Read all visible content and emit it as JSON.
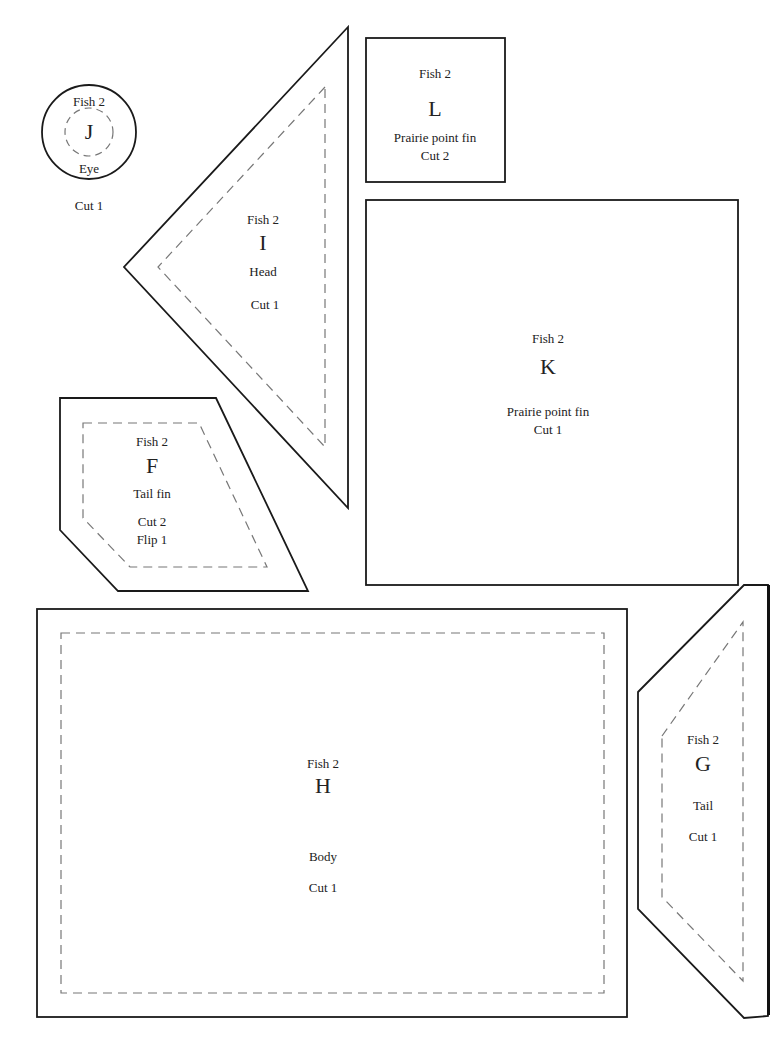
{
  "page": {
    "colors": {
      "outline": "#1a1a1a",
      "seam": "#777777",
      "background": "#ffffff"
    }
  },
  "pieces": {
    "J": {
      "group": "Fish 2",
      "letter": "J",
      "name": "Eye",
      "cut": "Cut 1"
    },
    "L": {
      "group": "Fish 2",
      "letter": "L",
      "name": "Prairie point fin",
      "cut": "Cut 2"
    },
    "I": {
      "group": "Fish 2",
      "letter": "I",
      "name": "Head",
      "cut": "Cut 1"
    },
    "K": {
      "group": "Fish 2",
      "letter": "K",
      "name": "Prairie point fin",
      "cut": "Cut 1"
    },
    "F": {
      "group": "Fish 2",
      "letter": "F",
      "name": "Tail fin",
      "cut": "Cut 2",
      "note": "Flip 1"
    },
    "H": {
      "group": "Fish 2",
      "letter": "H",
      "name": "Body",
      "cut": "Cut 1"
    },
    "G": {
      "group": "Fish 2",
      "letter": "G",
      "name": "Tail",
      "cut": "Cut 1"
    }
  }
}
